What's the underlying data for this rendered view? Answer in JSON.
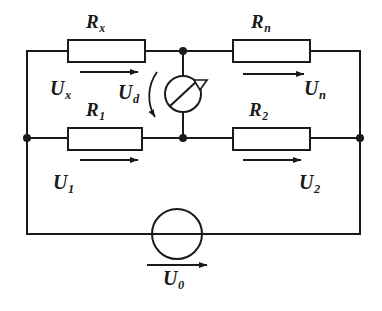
{
  "figure": {
    "type": "electrical-schematic",
    "background_color": "#ffffff",
    "line_color": "#1a1a1a"
  },
  "components": {
    "resistors": [
      {
        "id": "rx",
        "label": "R",
        "subscript": "x",
        "position": "top-left",
        "box": {
          "x": 68,
          "y": 40,
          "w": 77,
          "h": 22
        }
      },
      {
        "id": "rn",
        "label": "R",
        "subscript": "n",
        "position": "top-right",
        "box": {
          "x": 233,
          "y": 40,
          "w": 77,
          "h": 22
        }
      },
      {
        "id": "r1",
        "label": "R",
        "subscript": "1",
        "position": "middle-left",
        "box": {
          "x": 68,
          "y": 128,
          "w": 74,
          "h": 22
        }
      },
      {
        "id": "r2",
        "label": "R",
        "subscript": "2",
        "position": "middle-right",
        "box": {
          "x": 233,
          "y": 128,
          "w": 77,
          "h": 22
        }
      }
    ],
    "galvanometer": {
      "id": "galvanometer",
      "symbol": "circle-with-needle",
      "center_x": 183,
      "center_y": 94,
      "radius": 18
    },
    "source": {
      "id": "voltage-source",
      "symbol": "circle",
      "center_x": 177,
      "center_y": 234,
      "radius": 25
    },
    "nodes": [
      {
        "id": "node-top-center",
        "x": 183,
        "y": 51
      },
      {
        "id": "node-middle-center",
        "x": 183,
        "y": 138
      },
      {
        "id": "node-middle-left",
        "x": 27,
        "y": 138
      },
      {
        "id": "node-middle-right",
        "x": 360,
        "y": 138
      }
    ]
  },
  "voltages": {
    "ux": {
      "label": "U",
      "subscript": "x",
      "name": "voltage-across-rx",
      "arrow": "right"
    },
    "un": {
      "label": "U",
      "subscript": "n",
      "name": "voltage-across-rn",
      "arrow": "right"
    },
    "u1": {
      "label": "U",
      "subscript": "1",
      "name": "voltage-across-r1",
      "arrow": "right"
    },
    "u2": {
      "label": "U",
      "subscript": "2",
      "name": "voltage-across-r2",
      "arrow": "right"
    },
    "ud": {
      "label": "U",
      "subscript": "d",
      "name": "bridge-diagonal-voltage",
      "arrow": "curved-down"
    },
    "u0": {
      "label": "U",
      "subscript": "0",
      "name": "source-voltage",
      "arrow": "right"
    }
  }
}
